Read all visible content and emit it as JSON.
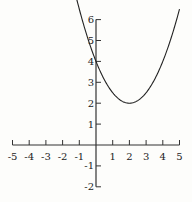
{
  "chart_data": {
    "type": "line",
    "title": "",
    "xlabel": "",
    "ylabel": "",
    "xlim": [
      -5,
      5
    ],
    "ylim": [
      -2,
      6
    ],
    "grid": false,
    "x_ticks": [
      -5,
      -4,
      -3,
      -2,
      -1,
      1,
      2,
      3,
      4,
      5
    ],
    "x_tick_labels": [
      "-5",
      "-4",
      "-3",
      "-2",
      "-1",
      "1",
      "2",
      "3",
      "4",
      "5"
    ],
    "y_ticks": [
      -2,
      -1,
      1,
      2,
      3,
      4,
      5,
      6
    ],
    "y_tick_labels": [
      "-2",
      "-1",
      "1",
      "2",
      "3",
      "4",
      "5",
      "6"
    ],
    "series": [
      {
        "name": "parabola",
        "equation": "y = 0.5(x - 2)^2 + 2",
        "vertex": [
          2,
          2
        ],
        "x": [
          -1.4,
          -1,
          0,
          1,
          2,
          3,
          4,
          5
        ],
        "values": [
          7.78,
          6.5,
          4,
          2.5,
          2,
          2.5,
          4,
          6.5
        ]
      }
    ]
  }
}
